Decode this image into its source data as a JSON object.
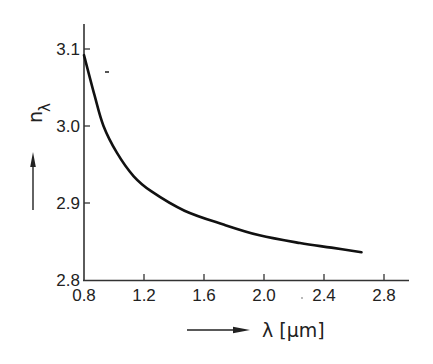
{
  "chart_data": {
    "type": "line",
    "title": "",
    "xlabel": "λ [μm]",
    "ylabel": "nλ",
    "ylabel_main": "n",
    "ylabel_sub": "λ",
    "xlim": [
      0.8,
      2.93
    ],
    "ylim": [
      2.8,
      3.135
    ],
    "xticks": [
      0.8,
      1.2,
      1.6,
      2.0,
      2.4,
      2.8
    ],
    "xtick_labels": [
      "0.8",
      "1.2",
      "1.6",
      "2.0",
      "2.4",
      "2.8"
    ],
    "yticks": [
      2.8,
      2.9,
      3.0,
      3.1
    ],
    "ytick_labels": [
      "2.8",
      "2.9",
      "3.0",
      "3.1"
    ],
    "grid": false,
    "legend": null,
    "series": [
      {
        "name": "refractive index",
        "x": [
          0.8,
          0.87,
          0.93,
          1.02,
          1.13,
          1.25,
          1.47,
          1.73,
          1.97,
          2.24,
          2.45,
          2.65
        ],
        "y": [
          3.092,
          3.04,
          3.0,
          2.965,
          2.935,
          2.915,
          2.89,
          2.872,
          2.858,
          2.848,
          2.842,
          2.836
        ]
      }
    ]
  },
  "colors": {
    "line": "#111111",
    "axis": "#333333",
    "background": "#ffffff"
  }
}
